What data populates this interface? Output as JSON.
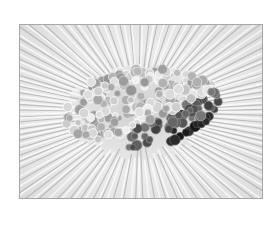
{
  "image": {
    "alt": "Grayscale photograph of embroidery: radiating straight stitches around a dense cluster of French knots, light on top and dark along the lower edge",
    "subject": "embroidered flower with french knot center",
    "colors": {
      "background": "#ffffff",
      "border": "#a8a8a8",
      "stitch_light": "#f2f2f2",
      "stitch_mid": "#bdbdbd",
      "knot_light": "#d8d8d8",
      "knot_mid": "#8a8a8a",
      "knot_dark": "#1a1a1a"
    }
  }
}
